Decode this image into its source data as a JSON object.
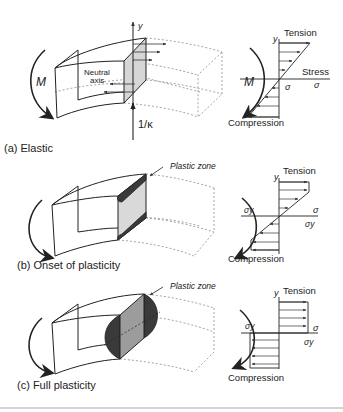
{
  "figure": {
    "panels": [
      {
        "id": "a",
        "caption": "(a) Elastic",
        "moment_label": "M",
        "neutral_axis_label_line1": "Neutral",
        "neutral_axis_label_line2": "axis",
        "y_axis_label": "y",
        "curvature_label": "1/κ",
        "stress_diagram": {
          "y_label": "y",
          "top_label": "Tension",
          "bottom_label": "Compression",
          "axis_label": "Stress",
          "sigma_left": "σ",
          "sigma_right": "σ",
          "distribution": "linear"
        }
      },
      {
        "id": "b",
        "caption": "(b) Onset of plasticity",
        "zone_label": "Plastic zone",
        "stress_diagram": {
          "y_label": "y",
          "top_label": "Tension",
          "bottom_label": "Compression",
          "sigma_left": "σy",
          "sigma_right": "σ",
          "sigma_right_below": "σy",
          "distribution": "elastic-plastic"
        }
      },
      {
        "id": "c",
        "caption": "(c) Full plasticity",
        "zone_label": "Plastic zone",
        "stress_diagram": {
          "y_label": "y",
          "top_label": "Tension",
          "bottom_label": "Compression",
          "sigma_left": "σy",
          "sigma_right": "σ",
          "sigma_right_below": "σy",
          "distribution": "fully-plastic"
        }
      }
    ],
    "colors": {
      "line": "#222222",
      "dashed": "#9a9a9a",
      "section_fill": "#d6d6d6",
      "plastic_fill": "#3a3a3a",
      "full_section_fill": "#9c9c9c",
      "rule": "#d4d4d4"
    }
  }
}
